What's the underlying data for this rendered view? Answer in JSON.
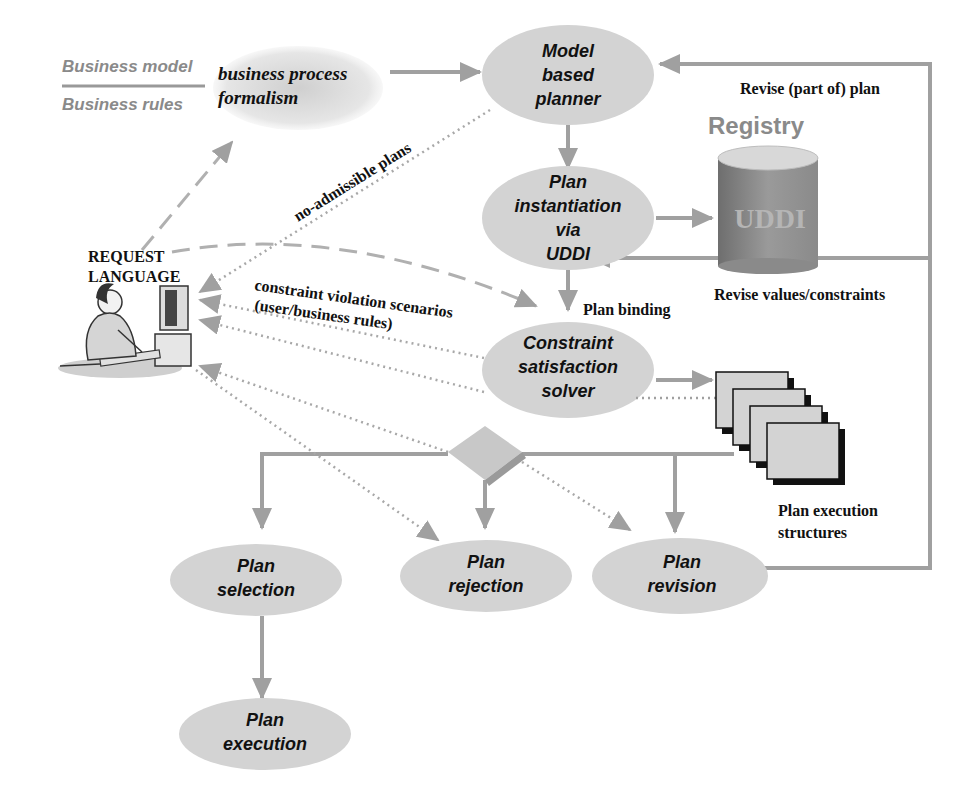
{
  "colors": {
    "arrow": "#a0a0a0",
    "node_fill": "#d3d3d3",
    "cylinder_body": "#8c8c8c",
    "cylinder_top": "#d8d8d8",
    "text": "#111111",
    "gray_text": "#8a8a8a"
  },
  "legend": {
    "business_model": "Business model",
    "business_rules": "Business rules"
  },
  "cloud": {
    "line1": "business process",
    "line2": "formalism"
  },
  "nodes": {
    "planner": {
      "line1": "Model",
      "line2": "based",
      "line3": "planner"
    },
    "instantiation": {
      "line1": "Plan",
      "line2": "instantiation",
      "line3": "via",
      "line4": "UDDI"
    },
    "solver": {
      "line1": "Constraint",
      "line2": "satisfaction",
      "line3": "solver"
    },
    "selection": {
      "line1": "Plan",
      "line2": "selection"
    },
    "rejection": {
      "line1": "Plan",
      "line2": "rejection"
    },
    "revision": {
      "line1": "Plan",
      "line2": "revision"
    },
    "execution": {
      "line1": "Plan",
      "line2": "execution"
    }
  },
  "registry": {
    "title": "Registry",
    "cylinder_label": "UDDI"
  },
  "user": {
    "line1": "REQUEST",
    "line2": "LANGUAGE"
  },
  "edge_labels": {
    "revise_plan": "Revise (part of) plan",
    "revise_values": "Revise values/constraints",
    "plan_binding": "Plan binding",
    "no_admissible": "no-admissible plans",
    "violation_line1": "constraint violation scenarios",
    "violation_line2": "(user/business rules)",
    "structures_line1": "Plan execution",
    "structures_line2": "structures"
  }
}
